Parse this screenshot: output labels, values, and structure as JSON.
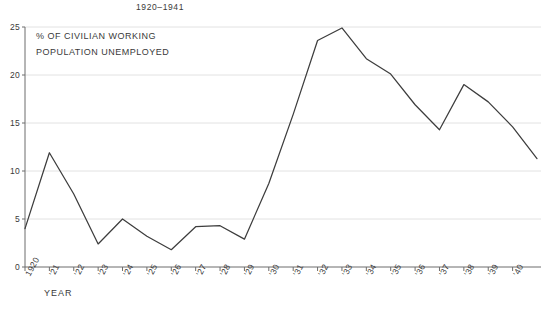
{
  "chart_data": {
    "type": "line",
    "title": "1920–1941",
    "annotation_lines": [
      "% OF CIVILIAN WORKING",
      "POPULATION UNEMPLOYED"
    ],
    "xlabel": "YEAR",
    "ylabel": "",
    "ylim": [
      0,
      25
    ],
    "yticks": [
      0,
      5,
      10,
      15,
      20,
      25
    ],
    "ytick_labels": [
      "0",
      "5",
      "10",
      "15",
      "20",
      "25"
    ],
    "grid": true,
    "legend": "none",
    "x": [
      1920,
      1921,
      1922,
      1923,
      1924,
      1925,
      1926,
      1927,
      1928,
      1929,
      1930,
      1931,
      1932,
      1933,
      1934,
      1935,
      1936,
      1937,
      1938,
      1939,
      1940,
      1941
    ],
    "xtick_labels": [
      "1920",
      "'21",
      "'22",
      "'23",
      "'24",
      "'25",
      "'26",
      "'27",
      "'28",
      "'29",
      "'30",
      "'31",
      "'32",
      "'33",
      "'34",
      "'35",
      "'36",
      "'37",
      "'38",
      "'39",
      "'40"
    ],
    "categories": [
      "1920",
      "'21",
      "'22",
      "'23",
      "'24",
      "'25",
      "'26",
      "'27",
      "'28",
      "'29",
      "'30",
      "'31",
      "'32",
      "'33",
      "'34",
      "'35",
      "'36",
      "'37",
      "'38",
      "'39",
      "'40",
      "'41"
    ],
    "values": [
      4.0,
      11.9,
      7.6,
      2.4,
      5.0,
      3.2,
      1.8,
      4.2,
      4.3,
      2.9,
      8.7,
      15.9,
      23.6,
      24.9,
      21.7,
      20.1,
      16.9,
      14.3,
      19.0,
      17.2,
      14.6,
      11.3
    ],
    "series": [
      {
        "name": "% of civilian working population unemployed",
        "color": "#3d3d3d",
        "values": [
          4.0,
          11.9,
          7.6,
          2.4,
          5.0,
          3.2,
          1.8,
          4.2,
          4.3,
          2.9,
          8.7,
          15.9,
          23.6,
          24.9,
          21.7,
          20.1,
          16.9,
          14.3,
          19.0,
          17.2,
          14.6,
          11.3
        ]
      }
    ],
    "colors": {
      "line": "#3d3d3d",
      "axis": "#6d6d6d",
      "grid": "#e2e2e2",
      "text": "#3a3a3a",
      "background": "#ffffff"
    }
  }
}
